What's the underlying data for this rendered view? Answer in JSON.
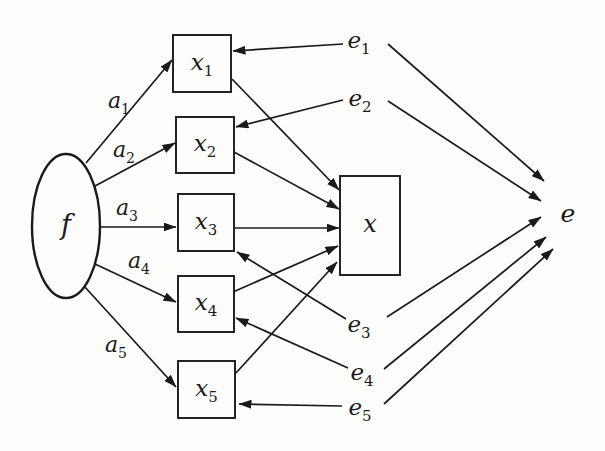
{
  "figure": {
    "background": "#fdfdfc",
    "ink": "#1a1a1a",
    "line_width": 1.7,
    "ellipse_stroke_width": 2.4,
    "rect_stroke_width": 1.9,
    "nodes": [
      {
        "id": "f",
        "name": "factor-f-node",
        "shape": "ellipse",
        "label": "f",
        "sub": "",
        "cx": 66,
        "cy": 226,
        "rx": 34,
        "ry": 72,
        "font": 27
      },
      {
        "id": "x1",
        "name": "x1-box",
        "shape": "rect",
        "label": "x",
        "sub": "1",
        "x": 173,
        "y": 35,
        "w": 58,
        "h": 57,
        "font": 23
      },
      {
        "id": "x2",
        "name": "x2-box",
        "shape": "rect",
        "label": "x",
        "sub": "2",
        "x": 176,
        "y": 117,
        "w": 58,
        "h": 56,
        "font": 23
      },
      {
        "id": "x3",
        "name": "x3-box",
        "shape": "rect",
        "label": "x",
        "sub": "3",
        "x": 178,
        "y": 194,
        "w": 56,
        "h": 57,
        "font": 23
      },
      {
        "id": "x4",
        "name": "x4-box",
        "shape": "rect",
        "label": "x",
        "sub": "4",
        "x": 178,
        "y": 276,
        "w": 56,
        "h": 56,
        "font": 23
      },
      {
        "id": "x5",
        "name": "x5-box",
        "shape": "rect",
        "label": "x",
        "sub": "5",
        "x": 178,
        "y": 361,
        "w": 57,
        "h": 57,
        "font": 23
      },
      {
        "id": "x",
        "name": "composite-x-box",
        "shape": "rect",
        "label": "x",
        "sub": "",
        "x": 340,
        "y": 176,
        "w": 60,
        "h": 99,
        "font": 24
      },
      {
        "id": "e1",
        "name": "e1-error-node",
        "shape": "text",
        "label": "e",
        "sub": "1",
        "cx": 359,
        "cy": 42,
        "font": 23
      },
      {
        "id": "e2",
        "name": "e2-error-node",
        "shape": "text",
        "label": "e",
        "sub": "2",
        "cx": 360,
        "cy": 100,
        "font": 23
      },
      {
        "id": "e3",
        "name": "e3-error-node",
        "shape": "text",
        "label": "e",
        "sub": "3",
        "cx": 359,
        "cy": 326,
        "font": 23
      },
      {
        "id": "e4",
        "name": "e4-error-node",
        "shape": "text",
        "label": "e",
        "sub": "4",
        "cx": 362,
        "cy": 374,
        "font": 23
      },
      {
        "id": "e5",
        "name": "e5-error-node",
        "shape": "text",
        "label": "e",
        "sub": "5",
        "cx": 360,
        "cy": 409,
        "font": 23
      },
      {
        "id": "e",
        "name": "composite-e-node",
        "shape": "text",
        "label": "e",
        "sub": "",
        "cx": 568,
        "cy": 215,
        "font": 25
      }
    ],
    "edges": [
      {
        "name": "f-to-x1",
        "x1": 86,
        "y1": 163,
        "x2": 172,
        "y2": 60,
        "label": "a",
        "sub": "1",
        "lx": 119,
        "ly": 101
      },
      {
        "name": "f-to-x2",
        "x1": 95,
        "y1": 186,
        "x2": 175,
        "y2": 143,
        "label": "a",
        "sub": "2",
        "lx": 124,
        "ly": 150
      },
      {
        "name": "f-to-x3",
        "x1": 100,
        "y1": 227,
        "x2": 176,
        "y2": 227,
        "label": "a",
        "sub": "3",
        "lx": 127,
        "ly": 208
      },
      {
        "name": "f-to-x4",
        "x1": 95,
        "y1": 264,
        "x2": 176,
        "y2": 302,
        "label": "a",
        "sub": "4",
        "lx": 139,
        "ly": 261
      },
      {
        "name": "f-to-x5",
        "x1": 84,
        "y1": 286,
        "x2": 176,
        "y2": 387,
        "label": "a",
        "sub": "5",
        "lx": 116,
        "ly": 345
      },
      {
        "name": "x1-to-x",
        "x1": 232,
        "y1": 79,
        "x2": 339,
        "y2": 190,
        "label": "",
        "sub": "",
        "lx": 0,
        "ly": 0
      },
      {
        "name": "x2-to-x",
        "x1": 234,
        "y1": 152,
        "x2": 339,
        "y2": 209,
        "label": "",
        "sub": "",
        "lx": 0,
        "ly": 0
      },
      {
        "name": "x3-to-x",
        "x1": 235,
        "y1": 228,
        "x2": 339,
        "y2": 228,
        "label": "",
        "sub": "",
        "lx": 0,
        "ly": 0
      },
      {
        "name": "x4-to-x",
        "x1": 233,
        "y1": 292,
        "x2": 338,
        "y2": 246,
        "label": "",
        "sub": "",
        "lx": 0,
        "ly": 0
      },
      {
        "name": "x5-to-x",
        "x1": 236,
        "y1": 373,
        "x2": 337,
        "y2": 262,
        "label": "",
        "sub": "",
        "lx": 0,
        "ly": 0
      },
      {
        "name": "e1-to-x1",
        "x1": 343,
        "y1": 44,
        "x2": 233,
        "y2": 51,
        "label": "",
        "sub": "",
        "lx": 0,
        "ly": 0
      },
      {
        "name": "e2-to-x2",
        "x1": 343,
        "y1": 100,
        "x2": 236,
        "y2": 127,
        "label": "",
        "sub": "",
        "lx": 0,
        "ly": 0
      },
      {
        "name": "e3-to-x3",
        "x1": 346,
        "y1": 319,
        "x2": 237,
        "y2": 252,
        "label": "",
        "sub": "",
        "lx": 0,
        "ly": 0
      },
      {
        "name": "e4-to-x4",
        "x1": 348,
        "y1": 368,
        "x2": 236,
        "y2": 318,
        "label": "",
        "sub": "",
        "lx": 0,
        "ly": 0
      },
      {
        "name": "e5-to-x5",
        "x1": 342,
        "y1": 406,
        "x2": 239,
        "y2": 404,
        "label": "",
        "sub": "",
        "lx": 0,
        "ly": 0
      },
      {
        "name": "e1-to-e",
        "x1": 388,
        "y1": 44,
        "x2": 544,
        "y2": 181,
        "label": "",
        "sub": "",
        "lx": 0,
        "ly": 0
      },
      {
        "name": "e2-to-e",
        "x1": 388,
        "y1": 101,
        "x2": 541,
        "y2": 201,
        "label": "",
        "sub": "",
        "lx": 0,
        "ly": 0
      },
      {
        "name": "e3-to-e",
        "x1": 387,
        "y1": 317,
        "x2": 541,
        "y2": 217,
        "label": "",
        "sub": "",
        "lx": 0,
        "ly": 0
      },
      {
        "name": "e4-to-e",
        "x1": 384,
        "y1": 369,
        "x2": 546,
        "y2": 237,
        "label": "",
        "sub": "",
        "lx": 0,
        "ly": 0
      },
      {
        "name": "e5-to-e",
        "x1": 384,
        "y1": 404,
        "x2": 553,
        "y2": 249,
        "label": "",
        "sub": "",
        "lx": 0,
        "ly": 0
      }
    ]
  }
}
